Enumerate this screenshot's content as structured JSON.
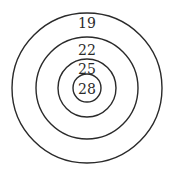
{
  "diagram": {
    "type": "concentric-circles-target",
    "center": {
      "x": 87,
      "y": 88
    },
    "rings": [
      {
        "label": "19",
        "radius": 75,
        "label_y": 28
      },
      {
        "label": "22",
        "radius": 51,
        "label_y": 55
      },
      {
        "label": "25",
        "radius": 29,
        "label_y": 74
      },
      {
        "label": "28",
        "radius": 14,
        "label_y": 94
      }
    ],
    "stroke_color": "#2a2a2a",
    "background": "#ffffff"
  }
}
